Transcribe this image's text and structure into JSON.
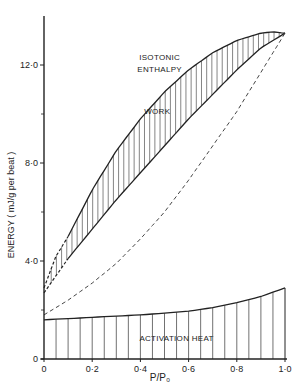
{
  "chart_data": {
    "type": "line",
    "title": "",
    "xlabel": "P/P₀",
    "ylabel": "ENERGY  ( mJ/g  per  beat )",
    "xlim": [
      0,
      1.0
    ],
    "ylim": [
      0,
      14
    ],
    "xticks": [
      0,
      0.2,
      0.4,
      0.6,
      0.8,
      1.0
    ],
    "xtick_labels": [
      "0",
      "0·2",
      "0·4",
      "0·6",
      "0·8",
      "1·0"
    ],
    "yticks": [
      0,
      4.0,
      8.0,
      12.0
    ],
    "ytick_labels": [
      "0",
      "4·0",
      "8·0",
      "12·0"
    ],
    "yminor_ticks": [
      2.0,
      6.0,
      10.0
    ],
    "grid": false,
    "legend": "none",
    "annotations": [
      {
        "text": "ISOTONIC",
        "x": 0.48,
        "y": 12.2
      },
      {
        "text": "ENTHALPY",
        "x": 0.48,
        "y": 11.7
      },
      {
        "text": "WORK",
        "x": 0.47,
        "y": 10.0
      },
      {
        "text": "ACTIVATION  HEAT",
        "x": 0.55,
        "y": 0.75
      }
    ],
    "series": [
      {
        "name": "Isotonic enthalpy (upper boundary of work)",
        "style": "solid",
        "x": [
          0,
          0.05,
          0.1,
          0.2,
          0.3,
          0.4,
          0.5,
          0.6,
          0.7,
          0.8,
          0.9,
          0.95,
          1.0
        ],
        "y": [
          2.9,
          4.2,
          5.0,
          6.9,
          8.5,
          9.8,
          10.9,
          11.8,
          12.5,
          13.0,
          13.3,
          13.35,
          13.3
        ],
        "dashed_x_range": [
          0,
          0.1
        ]
      },
      {
        "name": "Lower boundary of work (enthalpy minus work)",
        "style": "solid",
        "x": [
          0,
          0.05,
          0.1,
          0.2,
          0.3,
          0.4,
          0.5,
          0.6,
          0.7,
          0.8,
          0.9,
          1.0
        ],
        "y": [
          2.7,
          3.4,
          4.1,
          5.3,
          6.5,
          7.6,
          8.7,
          9.8,
          10.8,
          11.8,
          12.7,
          13.3
        ],
        "dashed_x_range": [
          0,
          0.1
        ]
      },
      {
        "name": "Dashed curve",
        "style": "dashed",
        "x": [
          0,
          0.1,
          0.2,
          0.3,
          0.4,
          0.5,
          0.6,
          0.7,
          0.8,
          0.9,
          1.0
        ],
        "y": [
          1.8,
          2.4,
          3.1,
          3.9,
          4.9,
          6.0,
          7.3,
          8.7,
          10.1,
          11.7,
          13.3
        ]
      },
      {
        "name": "Activation heat",
        "style": "solid",
        "x": [
          0,
          0.1,
          0.2,
          0.3,
          0.4,
          0.5,
          0.6,
          0.7,
          0.8,
          0.9,
          1.0
        ],
        "y": [
          1.6,
          1.65,
          1.7,
          1.75,
          1.8,
          1.87,
          1.95,
          2.1,
          2.3,
          2.55,
          2.9
        ]
      }
    ]
  },
  "plot_area": {
    "x0_px": 44,
    "x1_px": 285,
    "y0_px": 359,
    "px_per_y_unit": 24.5,
    "y_axis_top_px": 16
  }
}
